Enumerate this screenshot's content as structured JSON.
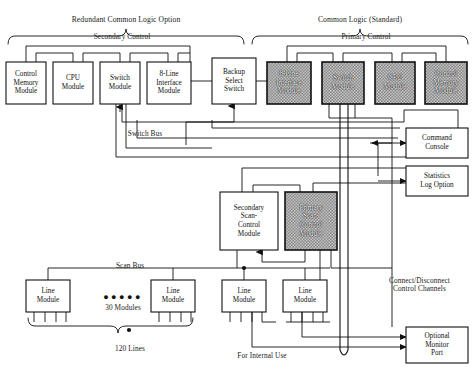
{
  "groups": [
    {
      "name": "redundant-group",
      "label": "Redundant Common Logic Option",
      "x": 8,
      "y": 16,
      "w": 236
    },
    {
      "name": "standard-group",
      "label": "Common Logic (Standard)",
      "x": 252,
      "y": 16,
      "w": 216
    }
  ],
  "section_labels": [
    {
      "name": "secondary-control",
      "label": "Secondary Control",
      "x": 52,
      "y": 33,
      "w": 140
    },
    {
      "name": "primary-control",
      "label": "Primary Control",
      "x": 296,
      "y": 33,
      "w": 140
    }
  ],
  "bus_labels": [
    {
      "name": "switch-bus-label",
      "label": "Switch Bus",
      "x": 105,
      "y": 130,
      "w": 80
    },
    {
      "name": "scan-bus-label",
      "label": "Scan Bus",
      "x": 95,
      "y": 262,
      "w": 70
    },
    {
      "name": "thirty-modules-label",
      "label": "30 Modules",
      "x": 93,
      "y": 304,
      "w": 60
    },
    {
      "name": "lines-count-label",
      "label": "120 Lines",
      "x": 100,
      "y": 345,
      "w": 60
    },
    {
      "name": "internal-use-label",
      "label": "For Internal Use",
      "x": 222,
      "y": 352,
      "w": 80
    },
    {
      "name": "connect-disconnect-label",
      "label": "Connect/Disconnect\nControl Channels",
      "x": 372,
      "y": 277,
      "w": 95
    }
  ],
  "modules": {
    "secondary_row": [
      {
        "name": "control-memory-module-secondary",
        "label": "Control\nMemory\nModule",
        "x": 6,
        "y": 62,
        "w": 40,
        "h": 42,
        "shaded": false
      },
      {
        "name": "cpu-module-secondary",
        "label": "CPU\nModule",
        "x": 53,
        "y": 62,
        "w": 40,
        "h": 42,
        "shaded": false
      },
      {
        "name": "switch-module-secondary",
        "label": "Switch\nModule",
        "x": 100,
        "y": 62,
        "w": 40,
        "h": 42,
        "shaded": false
      },
      {
        "name": "eight-line-interface-module-secondary",
        "label": "8-Line\nInterface\nModule",
        "x": 147,
        "y": 62,
        "w": 44,
        "h": 42,
        "shaded": false
      },
      {
        "name": "backup-select-switch",
        "label": "Backup\nSelect\nSwitch",
        "x": 212,
        "y": 58,
        "w": 44,
        "h": 46,
        "shaded": false
      }
    ],
    "primary_row": [
      {
        "name": "eight-line-interface-module-primary",
        "label": "8-Line\nInterface\nModule",
        "x": 267,
        "y": 62,
        "w": 44,
        "h": 42,
        "shaded": true
      },
      {
        "name": "switch-module-primary",
        "label": "Switch\nModule",
        "x": 322,
        "y": 62,
        "w": 42,
        "h": 42,
        "shaded": true
      },
      {
        "name": "cpu-module-primary",
        "label": "CPU\nModule",
        "x": 375,
        "y": 62,
        "w": 40,
        "h": 42,
        "shaded": true
      },
      {
        "name": "control-memory-module-primary",
        "label": "Control\nMemory\nModule",
        "x": 425,
        "y": 62,
        "w": 42,
        "h": 42,
        "shaded": true
      }
    ],
    "right_panels": [
      {
        "name": "command-console",
        "label": "Command\nConsole",
        "x": 406,
        "y": 128,
        "w": 62,
        "h": 30,
        "shaded": false
      },
      {
        "name": "statistics-log-option",
        "label": "Statistics\nLog Option",
        "x": 406,
        "y": 166,
        "w": 62,
        "h": 30,
        "shaded": false
      },
      {
        "name": "optional-monitor-port",
        "label": "Optional\nMonitor\nPort",
        "x": 406,
        "y": 327,
        "w": 62,
        "h": 36,
        "shaded": false
      }
    ],
    "scan_controls": [
      {
        "name": "secondary-scan-control-module",
        "label": "Secondary\nScan-\nControl\nModule",
        "x": 220,
        "y": 192,
        "w": 58,
        "h": 58,
        "shaded": false
      },
      {
        "name": "primary-scan-control-module",
        "label": "Primary\nScan-\nControl\nModule",
        "x": 285,
        "y": 192,
        "w": 52,
        "h": 58,
        "shaded": true
      }
    ],
    "line_modules": [
      {
        "name": "line-module-1",
        "label": "Line\nModule",
        "x": 26,
        "y": 280,
        "w": 44,
        "h": 32,
        "shaded": false
      },
      {
        "name": "line-module-2",
        "label": "Line\nModule",
        "x": 151,
        "y": 280,
        "w": 44,
        "h": 32,
        "shaded": false
      },
      {
        "name": "line-module-3",
        "label": "Line\nModule",
        "x": 222,
        "y": 280,
        "w": 44,
        "h": 32,
        "shaded": false
      },
      {
        "name": "line-module-4",
        "label": "Line\nModule",
        "x": 283,
        "y": 280,
        "w": 44,
        "h": 32,
        "shaded": false
      }
    ]
  },
  "colors": {
    "stroke": "#111111",
    "shaded_fill": "#9a9a9a",
    "background": "#ffffff"
  }
}
